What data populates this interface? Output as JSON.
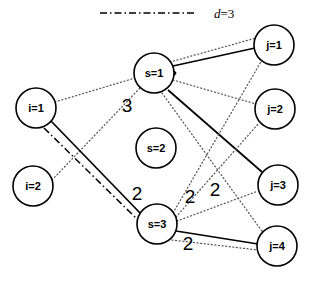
{
  "figure": {
    "title": "",
    "width": 309,
    "height": 284,
    "background": "#ffffff"
  },
  "legend": {
    "position": "top",
    "entries": [
      {
        "style": "dash-dot",
        "label": "d=3",
        "label_prefix": "d",
        "label_value": "3",
        "color": "#000000"
      }
    ]
  },
  "graph": {
    "type": "bipartite-assignment-diagram",
    "node_radius": 20,
    "nodes": [
      {
        "id": "i1",
        "label": "i=1",
        "x": 36,
        "y": 108,
        "group": "i"
      },
      {
        "id": "i2",
        "label": "i=2",
        "x": 33,
        "y": 186,
        "group": "i"
      },
      {
        "id": "s1",
        "label": "s=1",
        "x": 154,
        "y": 73,
        "group": "s"
      },
      {
        "id": "s2",
        "label": "s=2",
        "x": 156,
        "y": 148,
        "group": "s"
      },
      {
        "id": "s3",
        "label": "s=3",
        "x": 157,
        "y": 224,
        "group": "s"
      },
      {
        "id": "j1",
        "label": "j=1",
        "x": 274,
        "y": 45,
        "group": "j"
      },
      {
        "id": "j2",
        "label": "j=2",
        "x": 275,
        "y": 109,
        "group": "j"
      },
      {
        "id": "j3",
        "label": "j=3",
        "x": 278,
        "y": 185,
        "group": "j"
      },
      {
        "id": "j4",
        "label": "j=4",
        "x": 277,
        "y": 246,
        "group": "j"
      }
    ],
    "edges": [
      {
        "id": "e-i1-s1",
        "from": "i1",
        "to": "s1",
        "style": "dotted"
      },
      {
        "id": "e-i1-s3",
        "from": "i1",
        "to": "s3",
        "style": "solid"
      },
      {
        "id": "e-i1-s3b",
        "from": "i1",
        "to": "s3",
        "style": "dash-dot"
      },
      {
        "id": "e-i2-s1",
        "from": "i2",
        "to": "s1",
        "style": "dotted"
      },
      {
        "id": "e-s1-j1",
        "from": "s1",
        "to": "j1",
        "style": "solid"
      },
      {
        "id": "e-s1-j2",
        "from": "s1",
        "to": "j2",
        "style": "dotted"
      },
      {
        "id": "e-s1-j3",
        "from": "s1",
        "to": "j3",
        "style": "solid"
      },
      {
        "id": "e-s1-j4",
        "from": "s1",
        "to": "j4",
        "style": "dotted"
      },
      {
        "id": "e-s3-j1",
        "from": "s3",
        "to": "j1",
        "style": "dotted"
      },
      {
        "id": "e-s3-j2",
        "from": "s3",
        "to": "j2",
        "style": "dotted"
      },
      {
        "id": "e-s3-j3",
        "from": "s3",
        "to": "j3",
        "style": "dotted"
      },
      {
        "id": "e-s3-j4",
        "from": "s3",
        "to": "j4",
        "style": "solid"
      },
      {
        "id": "e-s3-j4b",
        "from": "s3",
        "to": "j4",
        "style": "dotted"
      }
    ],
    "edge_labels": [
      {
        "id": "w-3",
        "text": "3",
        "x": 127,
        "y": 105
      },
      {
        "id": "w-2a",
        "text": "2",
        "x": 137,
        "y": 193
      },
      {
        "id": "w-2b",
        "text": "2",
        "x": 190,
        "y": 196
      },
      {
        "id": "w-2c",
        "text": "2",
        "x": 215,
        "y": 189
      },
      {
        "id": "w-2d",
        "text": "2",
        "x": 188,
        "y": 243
      }
    ]
  }
}
